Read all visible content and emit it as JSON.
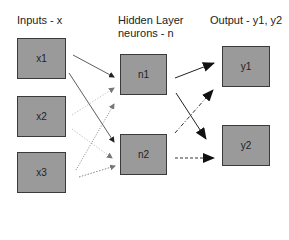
{
  "layers": {
    "input": {
      "title": "Inputs - x"
    },
    "hidden": {
      "title_line1": "Hidden Layer",
      "title_line2": "neurons - n"
    },
    "output": {
      "title": "Output - y1, y2"
    }
  },
  "nodes": {
    "x1": {
      "label": "x1"
    },
    "x2": {
      "label": "x2"
    },
    "x3": {
      "label": "x3"
    },
    "n1": {
      "label": "n1"
    },
    "n2": {
      "label": "n2"
    },
    "y1": {
      "label": "y1"
    },
    "y2": {
      "label": "y2"
    }
  },
  "edges": [
    {
      "from": "x1",
      "to": "n1",
      "style": "solid",
      "weight": "thin"
    },
    {
      "from": "x1",
      "to": "n2",
      "style": "solid",
      "weight": "thin"
    },
    {
      "from": "x2",
      "to": "n1",
      "style": "dotted-light",
      "weight": "thin"
    },
    {
      "from": "x2",
      "to": "n2",
      "style": "dotted-light",
      "weight": "thin"
    },
    {
      "from": "x3",
      "to": "n1",
      "style": "dotted",
      "weight": "thin"
    },
    {
      "from": "x3",
      "to": "n2",
      "style": "dotted",
      "weight": "thin"
    },
    {
      "from": "n1",
      "to": "y1",
      "style": "solid",
      "weight": "bold"
    },
    {
      "from": "n1",
      "to": "y2",
      "style": "solid",
      "weight": "bold"
    },
    {
      "from": "n2",
      "to": "y1",
      "style": "dash-dot",
      "weight": "bold"
    },
    {
      "from": "n2",
      "to": "y2",
      "style": "dashed",
      "weight": "bold"
    }
  ],
  "colors": {
    "node_fill": "#9a9a9a",
    "node_border": "#3a3a3a",
    "edge_dark": "#222222",
    "edge_light": "#aaaaaa"
  }
}
